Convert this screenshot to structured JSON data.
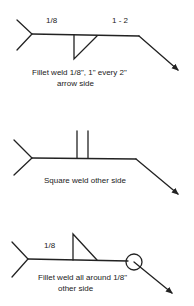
{
  "colors": {
    "line": "#222222",
    "background": "#ffffff"
  },
  "symbols": [
    {
      "name": "fillet-weld-arrow-side",
      "size_label": "1/8",
      "pitch_label": "1 - 2",
      "caption_line1": "Fillet weld 1/8\", 1\" every 2\"",
      "caption_line2": "arrow side"
    },
    {
      "name": "square-weld-other-side",
      "caption_line1": "Square weld other side"
    },
    {
      "name": "fillet-weld-all-around-other-side",
      "size_label": "1/8",
      "caption_line1": "Fillet weld all around 1/8\"",
      "caption_line2": "other side"
    }
  ]
}
